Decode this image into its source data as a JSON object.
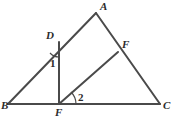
{
  "figure": {
    "background_color": "#ffffff",
    "line_color": "#4a4a4a",
    "label_color": "#2b2b2b",
    "stroke_width": 2,
    "arc_stroke_width": 1,
    "points": {
      "A": {
        "x": 96,
        "y": 13
      },
      "B": {
        "x": 8,
        "y": 104
      },
      "C": {
        "x": 160,
        "y": 104
      },
      "D": {
        "x": 59,
        "y": 42
      },
      "F_side": {
        "x": 118,
        "y": 52
      },
      "F_base": {
        "x": 59,
        "y": 104
      }
    },
    "segments": [
      {
        "name": "side-BA",
        "from": "B",
        "to": "A"
      },
      {
        "name": "side-AC",
        "from": "A",
        "to": "C"
      },
      {
        "name": "side-BC",
        "from": "B",
        "to": "C"
      },
      {
        "name": "segment-D-Fbase",
        "from": "D",
        "to": "F_base"
      },
      {
        "name": "segment-Fbase-Fside",
        "from": "F_base",
        "to": "F_side"
      }
    ],
    "labels": [
      {
        "name": "vertex-label-A",
        "text": "A",
        "x": 100,
        "y": 10,
        "kind": "vertex"
      },
      {
        "name": "vertex-label-B",
        "text": "B",
        "x": 1,
        "y": 109,
        "kind": "vertex"
      },
      {
        "name": "vertex-label-C",
        "text": "C",
        "x": 163,
        "y": 109,
        "kind": "vertex"
      },
      {
        "name": "vertex-label-D",
        "text": "D",
        "x": 46,
        "y": 39,
        "kind": "vertex"
      },
      {
        "name": "vertex-label-F-side",
        "text": "F",
        "x": 122,
        "y": 48,
        "kind": "vertex"
      },
      {
        "name": "vertex-label-F-base",
        "text": "F",
        "x": 55,
        "y": 116,
        "kind": "vertex"
      },
      {
        "name": "angle-label-1",
        "text": "1",
        "x": 50,
        "y": 67,
        "kind": "angle"
      },
      {
        "name": "angle-label-2",
        "text": "2",
        "x": 78,
        "y": 101,
        "kind": "angle"
      }
    ],
    "angle_arcs": [
      {
        "name": "angle-arc-1",
        "path": "M 50 53 A 12 12 0 0 0 59 57"
      },
      {
        "name": "angle-arc-2",
        "path": "M 76 104 A 17 17 0 0 0 71 92"
      }
    ]
  }
}
